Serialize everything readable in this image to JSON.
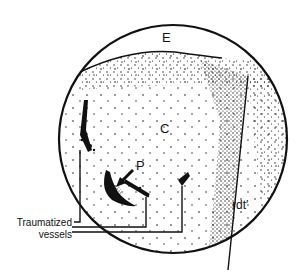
{
  "figure": {
    "labels": {
      "E": "E",
      "C": "C",
      "P": "P",
      "rdt": "rdt′",
      "traumatized_line1": "Traumatized",
      "traumatized_line2": "vessels"
    },
    "colors": {
      "ink": "#111111",
      "background": "#ffffff"
    }
  }
}
